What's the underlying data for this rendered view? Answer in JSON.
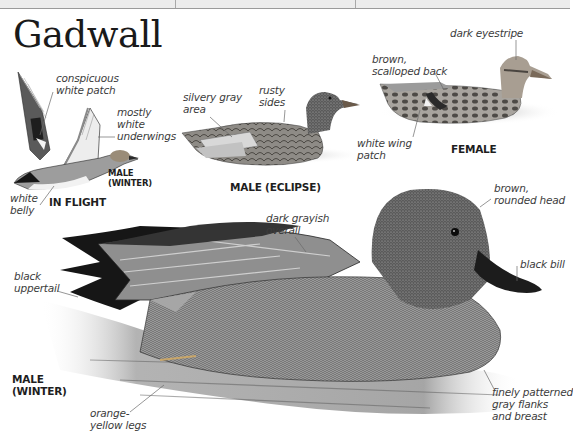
{
  "page": {
    "title": "Gadwall",
    "top_strip": {
      "dividers_x": [
        175,
        355
      ]
    }
  },
  "illustrations": [
    {
      "id": "in-flight",
      "caption": "IN FLIGHT",
      "sub_caption": "MALE\n(WINTER)",
      "labels": [
        "conspicuous\nwhite patch",
        "mostly\nwhite\nunderwings",
        "white\nbelly"
      ]
    },
    {
      "id": "male-eclipse",
      "caption": "MALE (ECLIPSE)",
      "labels": [
        "silvery gray\narea",
        "rusty\nsides"
      ]
    },
    {
      "id": "female",
      "caption": "FEMALE",
      "labels": [
        "brown,\nscalloped back",
        "dark eyestripe",
        "white wing\npatch"
      ]
    },
    {
      "id": "male-winter",
      "caption": "MALE\n(WINTER)",
      "labels": [
        "dark grayish\noverall",
        "brown,\nrounded head",
        "black bill",
        "black\nuppertail",
        "orange-\nyellow legs",
        "finely patterned\ngray flanks\nand breast"
      ]
    }
  ],
  "colors": {
    "text": "#3c3c3c",
    "title": "#1a1a1a",
    "leader": "#6a6a6a"
  }
}
